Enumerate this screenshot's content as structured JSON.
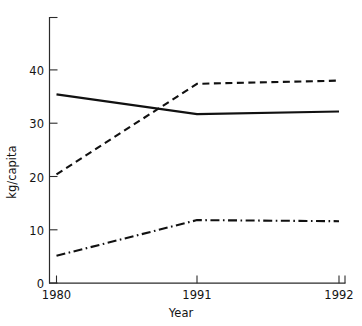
{
  "chart_data": {
    "type": "line",
    "title": "",
    "subtitle": "",
    "xlabel": "Year",
    "ylabel": "kg/capita",
    "x": [
      1980,
      1991,
      1992
    ],
    "categories": [
      "1980",
      "1991",
      "1992"
    ],
    "xtick_labels": [
      "1980",
      "1991",
      "1992"
    ],
    "ytick_labels": [
      "0",
      "10",
      "20",
      "30",
      "40"
    ],
    "ytick_values": [
      0,
      10,
      20,
      30,
      40
    ],
    "xlim": [
      1980,
      1992
    ],
    "ylim": [
      0,
      49.5
    ],
    "grid": false,
    "legend": "none",
    "series": [
      {
        "name": "series-solid",
        "style": "solid",
        "color": "#111111",
        "values": [
          35.4,
          31.7,
          32.2
        ]
      },
      {
        "name": "series-dashed",
        "style": "dashed",
        "color": "#111111",
        "values": [
          20.4,
          37.4,
          38.0
        ]
      },
      {
        "name": "series-dashdot",
        "style": "dash-dot",
        "color": "#111111",
        "values": [
          5.1,
          11.8,
          11.6
        ]
      }
    ],
    "annotations": []
  },
  "axes": {
    "y": {
      "label": "kg/capita",
      "ticks": [
        {
          "label": "0",
          "value": 0
        },
        {
          "label": "10",
          "value": 10
        },
        {
          "label": "20",
          "value": 20
        },
        {
          "label": "30",
          "value": 30
        },
        {
          "label": "40",
          "value": 40
        }
      ]
    },
    "x": {
      "label": "Year",
      "ticks": [
        {
          "label": "1980",
          "value": 1980
        },
        {
          "label": "1991",
          "value": 1991
        },
        {
          "label": "1992",
          "value": 1992
        }
      ]
    }
  },
  "style": {
    "background": "#ffffff",
    "axis_color": "#2b2b2b",
    "line_color": "#111111",
    "text_color": "#141414"
  }
}
